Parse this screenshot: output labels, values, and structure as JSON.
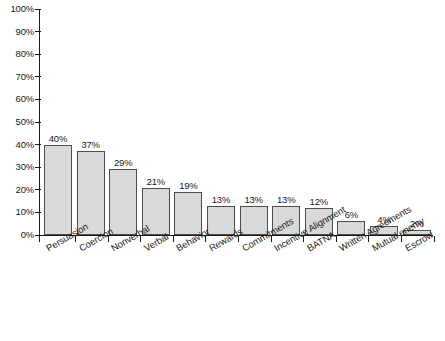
{
  "chart_data": {
    "type": "bar",
    "title": "",
    "xlabel": "",
    "ylabel": "",
    "ylim": [
      0,
      100
    ],
    "y_unit": "%",
    "grid": false,
    "legend": "none",
    "y_ticks": [
      "0%",
      "10%",
      "20%",
      "30%",
      "40%",
      "50%",
      "60%",
      "70%",
      "80%",
      "90%",
      "100%"
    ],
    "categories": [
      "Persuasion",
      "Coercion",
      "Nonverbal",
      "Verbal",
      "Behavior",
      "Rewards",
      "Commitments",
      "Incentive Alignment",
      "BATNA",
      "Written Agreements",
      "Mutual enemy",
      "Escrow"
    ],
    "values": [
      40,
      37,
      29,
      21,
      19,
      13,
      13,
      13,
      12,
      6,
      4,
      2
    ],
    "value_labels": [
      "40%",
      "37%",
      "29%",
      "21%",
      "19%",
      "13%",
      "13%",
      "13%",
      "12%",
      "6%",
      "4%",
      "2%"
    ]
  },
  "style": {
    "bar_fill": "#d9d9d9",
    "bar_stroke": "#4d4d4d",
    "axis_color": "#1a1a1a",
    "background": "#ffffff",
    "text_color": "#1a1a1a"
  }
}
